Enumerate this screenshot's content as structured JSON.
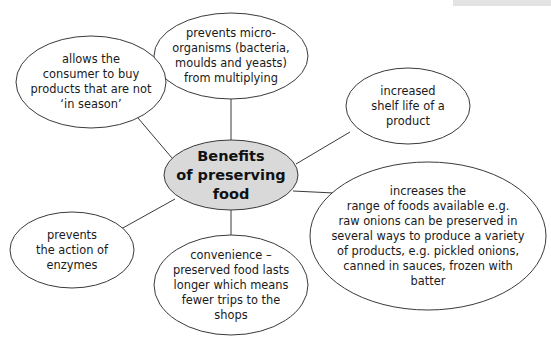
{
  "diagram": {
    "type": "mind-map",
    "colors": {
      "center_fill": "#d9d9d9",
      "node_fill": "#ffffff",
      "stroke": "#3a3a3a",
      "text": "#1a1a1a",
      "top_bar": "#e3e3e3"
    },
    "center": {
      "label": "Benefits\nof preserving\nfood"
    },
    "nodes": [
      {
        "id": "microorganisms",
        "label": "prevents micro-\norganisms (bacteria,\nmoulds and yeasts)\nfrom multiplying"
      },
      {
        "id": "in-season",
        "label": "allows the\nconsumer to buy\nproducts that are not\n‘in season’"
      },
      {
        "id": "shelf-life",
        "label": "increased\nshelf life of a\nproduct"
      },
      {
        "id": "range",
        "label": "increases the\nrange of foods available e.g.\nraw onions can be preserved in\nseveral ways to produce a variety\nof products, e.g. pickled onions,\ncanned in sauces, frozen with\nbatter"
      },
      {
        "id": "enzymes",
        "label": "prevents\nthe action of\nenzymes"
      },
      {
        "id": "convenience",
        "label": "convenience –\npreserved food lasts\nlonger which means\nfewer trips to the\nshops"
      }
    ]
  }
}
